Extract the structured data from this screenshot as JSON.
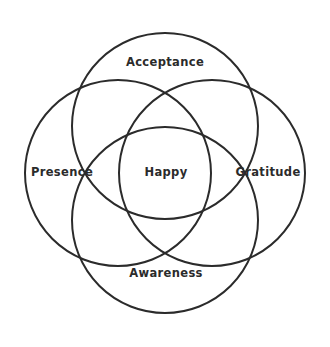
{
  "diagram": {
    "type": "venn-4-circle",
    "background_color": "#ffffff",
    "stroke_color": "#2b2b2b",
    "text_color": "#2b2b2b",
    "stroke_width": 2,
    "canvas": {
      "width": 330,
      "height": 347
    },
    "center": {
      "x": 165,
      "y": 173
    },
    "circle_radius": 93,
    "circle_offset": 47,
    "circles": [
      {
        "id": "acceptance",
        "label": "Acceptance",
        "position": "top",
        "cx": 165,
        "cy": 126
      },
      {
        "id": "presence",
        "label": "Presence",
        "position": "left",
        "cx": 118,
        "cy": 173
      },
      {
        "id": "gratitude",
        "label": "Gratitude",
        "position": "right",
        "cx": 212,
        "cy": 173
      },
      {
        "id": "awareness",
        "label": "Awareness",
        "position": "bottom",
        "cx": 165,
        "cy": 220
      }
    ],
    "labels": {
      "top": {
        "text": "Acceptance",
        "x": 165,
        "y": 63
      },
      "left": {
        "text": "Presence",
        "x": 62,
        "y": 173
      },
      "right": {
        "text": "Gratitude",
        "x": 268,
        "y": 173
      },
      "bottom": {
        "text": "Awareness",
        "x": 166,
        "y": 274
      },
      "center": {
        "text": "Happy",
        "x": 166,
        "y": 173
      }
    }
  }
}
